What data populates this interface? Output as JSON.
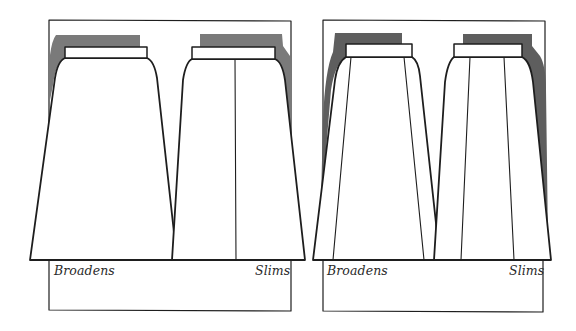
{
  "figure": {
    "colors": {
      "ink": "#1e1e1e",
      "shadow": "#7a7a7a",
      "background": "#ffffff"
    },
    "panels": [
      {
        "id": "panel-1",
        "left_skirt": {
          "style": "plain A-line, no seams",
          "label": "Broadens"
        },
        "right_skirt": {
          "style": "A-line with single center seam",
          "label": "Slims"
        }
      },
      {
        "id": "panel-2",
        "left_skirt": {
          "style": "gored skirt with wide-set panel seams",
          "label": "Broadens"
        },
        "right_skirt": {
          "style": "gored skirt with narrow-set panel seams",
          "label": "Slims"
        }
      }
    ]
  }
}
